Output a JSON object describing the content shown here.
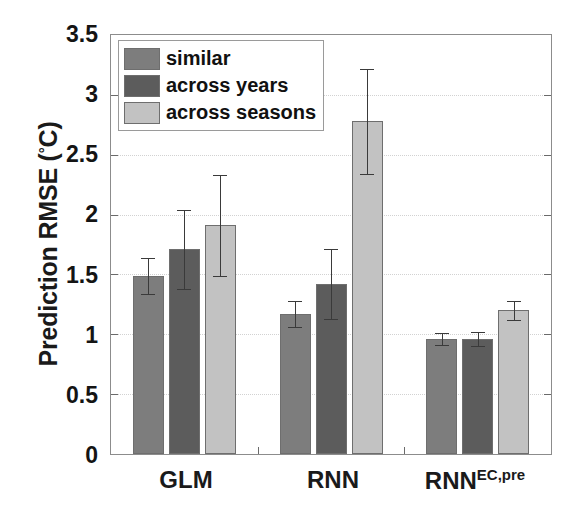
{
  "chart_data": {
    "type": "bar",
    "title": "",
    "xlabel": "",
    "ylabel": "Prediction RMSE (°C)",
    "ylabel_main": "Prediction RMSE (",
    "ylabel_deg": "°",
    "ylabel_tail": "C)",
    "categories": [
      "GLM",
      "RNN",
      "RNN"
    ],
    "category_superscripts": [
      "",
      "",
      "EC,pre"
    ],
    "ylim": [
      0,
      3.5
    ],
    "yticks": [
      0,
      0.5,
      1,
      1.5,
      2,
      2.5,
      3,
      3.5
    ],
    "ytick_labels": [
      "0",
      "0.5",
      "1",
      "1.5",
      "2",
      "2.5",
      "3",
      "3.5"
    ],
    "grid": true,
    "legend_position": "top-left",
    "series": [
      {
        "name": "similar",
        "color": "#7d7d7d",
        "values": [
          1.49,
          1.17,
          0.96
        ],
        "errors": [
          0.15,
          0.11,
          0.05
        ]
      },
      {
        "name": "across years",
        "color": "#5c5c5c",
        "values": [
          1.71,
          1.42,
          0.96
        ],
        "errors": [
          0.33,
          0.29,
          0.06
        ]
      },
      {
        "name": "across seasons",
        "color": "#c2c2c2",
        "values": [
          1.91,
          2.78,
          1.2
        ],
        "errors": [
          0.42,
          0.44,
          0.08
        ]
      }
    ]
  },
  "legend": {
    "items": [
      {
        "label": "similar",
        "color": "#7d7d7d"
      },
      {
        "label": "across years",
        "color": "#5c5c5c"
      },
      {
        "label": "across seasons",
        "color": "#c2c2c2"
      }
    ]
  },
  "axes": {
    "y_title_main": "Prediction RMSE (",
    "y_title_deg": "°",
    "y_title_tail": "C)",
    "y_tick_labels": [
      "3.5",
      "3",
      "2.5",
      "2",
      "1.5",
      "1",
      "0.5",
      "0"
    ],
    "x_tick_labels": [
      "GLM",
      "RNN",
      "RNN"
    ],
    "x_tick_superscripts": [
      "",
      "",
      "EC,pre"
    ]
  }
}
